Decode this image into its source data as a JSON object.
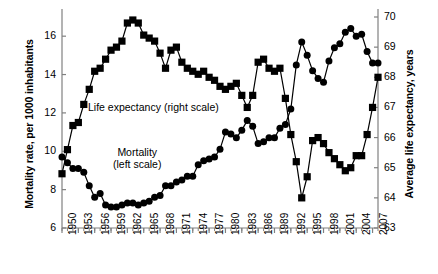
{
  "chart_data": {
    "type": "line",
    "title": "",
    "xlabel": "",
    "ylabel": "Mortality rate, per 1000 inhabitants",
    "y2label": "Average life expectancy, years",
    "ylim": [
      6,
      17
    ],
    "y2lim": [
      63,
      70
    ],
    "xlim": [
      1950,
      2008
    ],
    "grid": false,
    "legend": "inline-annotations",
    "yticks": [
      6,
      8,
      10,
      12,
      14,
      16
    ],
    "y2ticks": [
      63,
      64,
      65,
      66,
      67,
      68,
      69,
      70
    ],
    "xticks": [
      1950,
      1953,
      1956,
      1959,
      1962,
      1965,
      1968,
      1971,
      1974,
      1977,
      1980,
      1983,
      1986,
      1989,
      1992,
      1995,
      1998,
      2001,
      2004,
      2007
    ],
    "x": [
      1950,
      1951,
      1952,
      1953,
      1954,
      1955,
      1956,
      1957,
      1958,
      1959,
      1960,
      1961,
      1962,
      1963,
      1964,
      1965,
      1966,
      1967,
      1968,
      1969,
      1970,
      1971,
      1972,
      1973,
      1974,
      1975,
      1976,
      1977,
      1978,
      1979,
      1980,
      1981,
      1982,
      1983,
      1984,
      1985,
      1986,
      1987,
      1988,
      1989,
      1990,
      1991,
      1992,
      1993,
      1994,
      1995,
      1996,
      1997,
      1998,
      1999,
      2000,
      2001,
      2002,
      2003,
      2004,
      2005,
      2006,
      2007,
      2008
    ],
    "series": [
      {
        "name": "Mortality (left scale)",
        "axis": "left",
        "marker": "circle",
        "units": "per 1000 inhabitants",
        "values": [
          9.7,
          9.4,
          9.1,
          9.1,
          8.9,
          8.2,
          7.6,
          7.8,
          7.2,
          7.1,
          7.1,
          7.2,
          7.3,
          7.3,
          7.2,
          7.3,
          7.4,
          7.6,
          7.7,
          8.2,
          8.2,
          8.4,
          8.5,
          8.7,
          8.7,
          9.3,
          9.5,
          9.6,
          9.7,
          10.1,
          11.0,
          10.9,
          10.7,
          11.1,
          11.6,
          11.3,
          10.4,
          10.5,
          10.7,
          10.7,
          11.2,
          11.4,
          12.2,
          14.5,
          15.7,
          15.0,
          14.2,
          13.8,
          13.6,
          14.7,
          15.4,
          15.6,
          16.2,
          16.4,
          16.0,
          16.1,
          15.2,
          14.6,
          14.6
        ]
      },
      {
        "name": "Life expectancy (right scale)",
        "axis": "right",
        "marker": "square",
        "units": "years",
        "values": [
          64.8,
          65.6,
          66.4,
          66.5,
          67.1,
          67.6,
          68.2,
          68.3,
          68.6,
          68.9,
          69.0,
          69.2,
          69.8,
          69.9,
          69.8,
          69.4,
          69.3,
          69.2,
          68.8,
          68.3,
          68.9,
          69.0,
          68.5,
          68.3,
          68.2,
          68.1,
          68.2,
          68.0,
          67.9,
          67.7,
          67.6,
          67.7,
          67.8,
          67.4,
          67.0,
          67.4,
          68.5,
          68.6,
          68.3,
          68.2,
          68.3,
          67.3,
          66.1,
          65.2,
          64.0,
          64.7,
          65.9,
          66.0,
          65.8,
          65.5,
          65.3,
          65.1,
          64.9,
          65.0,
          65.4,
          65.4,
          66.1,
          67.0,
          68.0
        ]
      }
    ],
    "annotations": [
      {
        "text": "Life expectancy (right scale)",
        "refers_to": "Life expectancy (right scale)"
      },
      {
        "text": "Mortality",
        "refers_to": "Mortality (left scale)"
      },
      {
        "text": "(left scale)",
        "refers_to": "Mortality (left scale)"
      }
    ],
    "colors": {
      "line": "#000000",
      "marker": "#000000",
      "axis": "#808080",
      "background": "#ffffff"
    }
  },
  "labels": {
    "left_axis_title": "Mortality rate, per 1000 inhabitants",
    "right_axis_title": "Average life expectancy, years",
    "life_expectancy_annotation": "Life expectancy (right scale)",
    "mortality_annotation_line1": "Mortality",
    "mortality_annotation_line2": "(left scale)"
  }
}
